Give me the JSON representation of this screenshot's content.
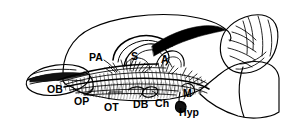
{
  "figure": {
    "kind": "line-drawing",
    "background_color": "#ffffff",
    "ink_color": "#000000"
  },
  "labels": [
    {
      "id": "OB",
      "text": "OB",
      "x": 47,
      "y": 84,
      "size": "big",
      "meaning": "olfactory bulb"
    },
    {
      "id": "OP",
      "text": "OP",
      "x": 74,
      "y": 96,
      "size": "big",
      "meaning": "olfactory peduncle"
    },
    {
      "id": "PA",
      "text": "PA",
      "x": 89,
      "y": 52,
      "size": "big",
      "meaning": "parietal area"
    },
    {
      "id": "S",
      "text": "S",
      "x": 131,
      "y": 51,
      "size": "big",
      "meaning": "septum"
    },
    {
      "id": "A",
      "text": "A",
      "x": 161,
      "y": 54,
      "size": "big",
      "meaning": "amygdala"
    },
    {
      "id": "OT",
      "text": "OT",
      "x": 104,
      "y": 102,
      "size": "big",
      "meaning": "olfactory tubercle"
    },
    {
      "id": "DB",
      "text": "DB",
      "x": 133,
      "y": 99,
      "size": "big",
      "meaning": "diagonal band"
    },
    {
      "id": "Ch",
      "text": "Ch",
      "x": 155,
      "y": 98,
      "size": "big",
      "meaning": "optic chiasm"
    },
    {
      "id": "M",
      "text": "M",
      "x": 183,
      "y": 88,
      "size": "big",
      "meaning": "mammillary body"
    },
    {
      "id": "Hyp",
      "text": "Hyp",
      "x": 179,
      "y": 107,
      "size": "big",
      "meaning": "hypophysis"
    }
  ]
}
